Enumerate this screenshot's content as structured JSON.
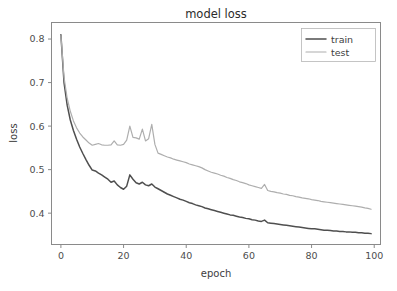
{
  "chart_data": {
    "type": "line",
    "title": "model loss",
    "xlabel": "epoch",
    "ylabel": "loss",
    "xlim": [
      -3,
      102
    ],
    "ylim": [
      0.328,
      0.838
    ],
    "xticks": [
      0,
      20,
      40,
      60,
      80,
      100
    ],
    "xtick_labels": [
      "0",
      "20",
      "40",
      "60",
      "80",
      "100"
    ],
    "yticks": [
      0.4,
      0.5,
      0.6,
      0.7,
      0.8
    ],
    "ytick_labels": [
      "0.4",
      "0.5",
      "0.6",
      "0.7",
      "0.8"
    ],
    "grid": false,
    "legend_position": "upper right",
    "colors": {
      "train": "#4f4f4f",
      "test": "#aeaeae",
      "axis": "#8a8a8a",
      "text": "#3d3d3d",
      "background": "#ffffff"
    },
    "x": [
      0,
      1,
      2,
      3,
      4,
      5,
      6,
      7,
      8,
      9,
      10,
      11,
      12,
      13,
      14,
      15,
      16,
      17,
      18,
      19,
      20,
      21,
      22,
      23,
      24,
      25,
      26,
      27,
      28,
      29,
      30,
      31,
      32,
      33,
      34,
      35,
      36,
      37,
      38,
      39,
      40,
      41,
      42,
      43,
      44,
      45,
      46,
      47,
      48,
      49,
      50,
      51,
      52,
      53,
      54,
      55,
      56,
      57,
      58,
      59,
      60,
      61,
      62,
      63,
      64,
      65,
      66,
      67,
      68,
      69,
      70,
      71,
      72,
      73,
      74,
      75,
      76,
      77,
      78,
      79,
      80,
      81,
      82,
      83,
      84,
      85,
      86,
      87,
      88,
      89,
      90,
      91,
      92,
      93,
      94,
      95,
      96,
      97,
      98,
      99
    ],
    "series": [
      {
        "name": "train",
        "label": "train",
        "color": "#4f4f4f",
        "linewidth": 1.5,
        "values": [
          0.81,
          0.7,
          0.648,
          0.614,
          0.59,
          0.57,
          0.552,
          0.537,
          0.523,
          0.51,
          0.499,
          0.497,
          0.492,
          0.488,
          0.483,
          0.478,
          0.471,
          0.474,
          0.465,
          0.459,
          0.455,
          0.462,
          0.488,
          0.478,
          0.47,
          0.467,
          0.471,
          0.465,
          0.463,
          0.467,
          0.46,
          0.456,
          0.452,
          0.448,
          0.444,
          0.441,
          0.438,
          0.435,
          0.432,
          0.43,
          0.427,
          0.424,
          0.422,
          0.419,
          0.417,
          0.415,
          0.412,
          0.41,
          0.408,
          0.406,
          0.404,
          0.402,
          0.4,
          0.398,
          0.396,
          0.395,
          0.393,
          0.391,
          0.39,
          0.388,
          0.387,
          0.385,
          0.384,
          0.382,
          0.381,
          0.384,
          0.378,
          0.377,
          0.376,
          0.375,
          0.374,
          0.373,
          0.372,
          0.371,
          0.37,
          0.369,
          0.368,
          0.367,
          0.366,
          0.365,
          0.364,
          0.364,
          0.363,
          0.362,
          0.361,
          0.361,
          0.36,
          0.359,
          0.359,
          0.358,
          0.358,
          0.357,
          0.357,
          0.356,
          0.356,
          0.355,
          0.355,
          0.354,
          0.354,
          0.353
        ]
      },
      {
        "name": "test",
        "label": "test",
        "color": "#aeaeae",
        "linewidth": 1.2,
        "values": [
          0.808,
          0.712,
          0.664,
          0.634,
          0.612,
          0.596,
          0.584,
          0.575,
          0.568,
          0.561,
          0.556,
          0.558,
          0.56,
          0.557,
          0.556,
          0.556,
          0.557,
          0.566,
          0.557,
          0.556,
          0.558,
          0.568,
          0.6,
          0.574,
          0.573,
          0.57,
          0.593,
          0.566,
          0.571,
          0.604,
          0.558,
          0.538,
          0.535,
          0.532,
          0.529,
          0.527,
          0.524,
          0.522,
          0.52,
          0.518,
          0.516,
          0.513,
          0.511,
          0.509,
          0.507,
          0.504,
          0.5,
          0.497,
          0.494,
          0.492,
          0.49,
          0.487,
          0.485,
          0.482,
          0.48,
          0.477,
          0.475,
          0.472,
          0.47,
          0.468,
          0.465,
          0.463,
          0.461,
          0.459,
          0.457,
          0.466,
          0.452,
          0.45,
          0.449,
          0.447,
          0.446,
          0.444,
          0.443,
          0.441,
          0.44,
          0.438,
          0.437,
          0.435,
          0.434,
          0.433,
          0.431,
          0.43,
          0.429,
          0.427,
          0.426,
          0.425,
          0.424,
          0.423,
          0.422,
          0.421,
          0.42,
          0.419,
          0.418,
          0.417,
          0.416,
          0.415,
          0.414,
          0.412,
          0.411,
          0.409
        ]
      }
    ]
  },
  "legend": {
    "entries": [
      {
        "label": "train",
        "color": "#4f4f4f"
      },
      {
        "label": "test",
        "color": "#aeaeae"
      }
    ]
  }
}
